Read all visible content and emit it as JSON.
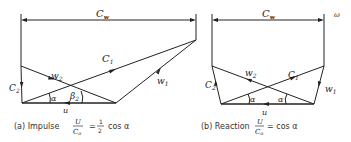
{
  "diagram_a": {
    "cw_label": "C",
    "cw_sub": "w",
    "c1_label": "C",
    "c1_sub": "1",
    "c2_label": "C",
    "c2_sub": "2",
    "w1_label": "w",
    "w1_sub": "1",
    "w2_label": "w",
    "w2_sub": "2",
    "u_label": "u",
    "alpha_label": "α",
    "beta_label": "β",
    "beta_sub": "2",
    "caption_prefix": "(a) Impulse",
    "caption_num": "U",
    "caption_den": "C",
    "caption_den_sub": "o",
    "caption_eq": "=",
    "caption_frac_num": "1",
    "caption_frac_den": "2",
    "caption_rest": "cos α"
  },
  "diagram_b": {
    "cw_label": "C",
    "cw_sub": "w",
    "c1_label": "C",
    "c1_sub": "1",
    "c2_label": "C",
    "c2_sub": "2",
    "w1_label": "w",
    "w1_sub": "1",
    "w2_label": "w",
    "w2_sub": "2",
    "u_label": "u",
    "alpha_left": "α",
    "alpha_right": "α",
    "caption_prefix": "(b) Reaction",
    "caption_num": "U",
    "caption_den": "C",
    "caption_den_sub": "o",
    "caption_rest": "= cos α"
  },
  "corner_mark": "ω"
}
